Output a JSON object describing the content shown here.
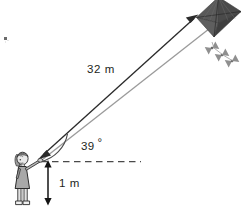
{
  "diagram": {
    "type": "trigonometry-figure",
    "background_color": "#ffffff",
    "width": 242,
    "height": 210,
    "labels": {
      "string_length": "32 m",
      "angle": "39",
      "degree_symbol": "°",
      "angle_full": "39°",
      "height": "1 m"
    },
    "objects": {
      "kite_name": "kite",
      "kite_fill": "#4f4f4f",
      "kite_stroke": "#2b2b2b",
      "tail_name": "kite-tail",
      "tail_fill": "#8c8c8c",
      "person_name": "girl-flying-kite",
      "person_dress_fill": "#a8a8a8",
      "person_stroke": "#2b2b2b",
      "string_color": "#9a9a9a",
      "arrow_color": "#2b2b2b",
      "dashed_color": "#4a4a4a"
    },
    "geometry": {
      "hand_x": 39,
      "hand_y": 159,
      "kite_anchor_x": 207,
      "kite_anchor_y": 15,
      "baseline_y": 161,
      "baseline_x_start": 41,
      "baseline_x_end": 141,
      "height_arrow_x": 48,
      "height_top_y": 161,
      "height_bottom_y": 205,
      "angle_degrees": 39
    }
  }
}
